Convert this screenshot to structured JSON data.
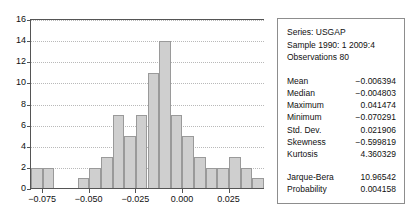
{
  "chart_data": {
    "type": "bar",
    "title": "",
    "xlabel": "",
    "ylabel": "",
    "xlim": [
      -0.0815,
      0.0435
    ],
    "ylim": [
      0,
      16
    ],
    "grid": true,
    "legend": "none",
    "bin_width": 0.00625,
    "categories": [
      "-0.0815",
      "-0.0753",
      "-0.0690",
      "-0.0628",
      "-0.0565",
      "-0.0503",
      "-0.0440",
      "-0.0378",
      "-0.0315",
      "-0.0253",
      "-0.0190",
      "-0.0128",
      "-0.0065",
      "-0.0003",
      "0.0060",
      "0.0122",
      "0.0185",
      "0.0247",
      "0.0310",
      "0.0372"
    ],
    "values": [
      2,
      2,
      0,
      0,
      1,
      2,
      3,
      7,
      5,
      7,
      11,
      14,
      7,
      5,
      3,
      2,
      2,
      3,
      2,
      1
    ],
    "y_ticks": [
      0,
      2,
      4,
      6,
      8,
      10,
      12,
      14,
      16
    ],
    "x_ticks": [
      -0.075,
      -0.05,
      -0.025,
      0.0,
      0.025
    ],
    "x_tick_labels": [
      "−0.075",
      "−0.050",
      "−0.025",
      "0.000",
      "0.025"
    ],
    "bar_fill": "#cfcfcf",
    "bar_stroke": "#9a9a9a",
    "axis_color": "#555555",
    "grid_color": "#b9b9b9"
  },
  "stats_panel": {
    "header": [
      "Series: USGAP",
      "Sample 1990: 1 2009:4",
      "Observations 80"
    ],
    "stats": [
      {
        "label": "Mean",
        "value": "−0.006394"
      },
      {
        "label": "Median",
        "value": "−0.004803"
      },
      {
        "label": "Maximum",
        "value": "0.041474"
      },
      {
        "label": "Minimum",
        "value": "−0.070291"
      },
      {
        "label": "Std. Dev.",
        "value": "0.021906"
      },
      {
        "label": "Skewness",
        "value": "−0.599819"
      },
      {
        "label": "Kurtosis",
        "value": "4.360329"
      }
    ],
    "tests": [
      {
        "label": "Jarque-Bera",
        "value": "10.96542"
      },
      {
        "label": "Probability",
        "value": "0.004158"
      }
    ],
    "border_color": "#8d8d8d"
  }
}
